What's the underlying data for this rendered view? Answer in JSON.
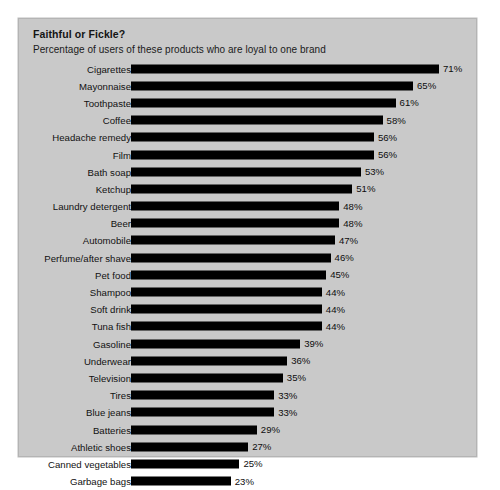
{
  "chart_data": {
    "type": "bar",
    "orientation": "horizontal",
    "title": "Faithful or Fickle?",
    "subtitle": "Percentage of users of these products who are loyal to one brand",
    "xlabel": "",
    "ylabel": "",
    "value_suffix": "%",
    "xlim": [
      0,
      71
    ],
    "grid": false,
    "legend": false,
    "bar_color": "#000000",
    "background_color": "#c9c9c9",
    "categories": [
      "Cigarettes",
      "Mayonnaise",
      "Toothpaste",
      "Coffee",
      "Headache remedy",
      "Film",
      "Bath soap",
      "Ketchup",
      "Laundry detergent",
      "Beer",
      "Automobile",
      "Perfume/after shave",
      "Pet food",
      "Shampoo",
      "Soft drink",
      "Tuna fish",
      "Gasoline",
      "Underwear",
      "Television",
      "Tires",
      "Blue jeans",
      "Batteries",
      "Athletic shoes",
      "Canned vegetables",
      "Garbage bags"
    ],
    "values": [
      71,
      65,
      61,
      58,
      56,
      56,
      53,
      51,
      48,
      48,
      47,
      46,
      45,
      44,
      44,
      44,
      39,
      36,
      35,
      33,
      33,
      29,
      27,
      25,
      23
    ],
    "value_labels": [
      "71%",
      "65%",
      "61%",
      "58%",
      "56%",
      "56%",
      "53%",
      "51%",
      "48%",
      "48%",
      "47%",
      "46%",
      "45%",
      "44%",
      "44%",
      "44%",
      "39%",
      "36%",
      "35%",
      "33%",
      "33%",
      "29%",
      "27%",
      "25%",
      "23%"
    ]
  }
}
